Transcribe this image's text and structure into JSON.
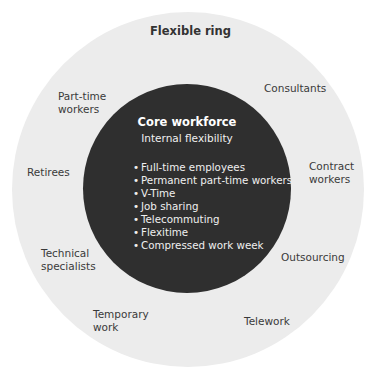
{
  "diagram": {
    "outer_ring": {
      "title": "Flexible ring",
      "color": "#ececec",
      "labels": [
        {
          "id": "part-time-workers",
          "lines": [
            "Part-time",
            "workers"
          ]
        },
        {
          "id": "consultants",
          "lines": [
            "Consultants"
          ]
        },
        {
          "id": "retirees",
          "lines": [
            "Retirees"
          ]
        },
        {
          "id": "contract-workers",
          "lines": [
            "Contract",
            "workers"
          ]
        },
        {
          "id": "technical-specialists",
          "lines": [
            "Technical",
            "specialists"
          ]
        },
        {
          "id": "outsourcing",
          "lines": [
            "Outsourcing"
          ]
        },
        {
          "id": "temporary-work",
          "lines": [
            "Temporary",
            "work"
          ]
        },
        {
          "id": "telework",
          "lines": [
            "Telework"
          ]
        }
      ]
    },
    "core": {
      "title": "Core workforce",
      "subtitle": "Internal flexibility",
      "color": "#2f2f2f",
      "bullet": "•",
      "items": [
        "Full-time employees",
        "Permanent part-time workers",
        "V-Time",
        "Job sharing",
        "Telecommuting",
        "Flexitime",
        "Compressed work week"
      ]
    }
  }
}
